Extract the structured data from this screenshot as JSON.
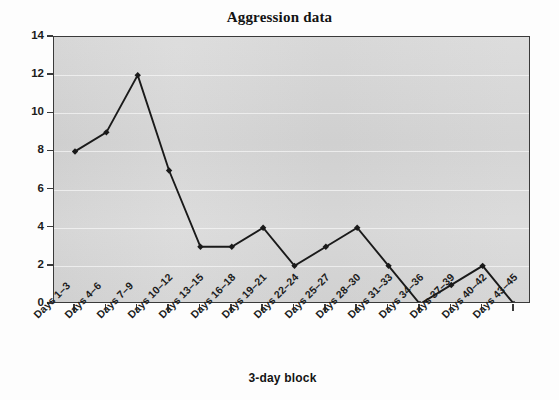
{
  "chart_data": {
    "type": "line",
    "title": "Aggression data",
    "xlabel": "3-day block",
    "ylabel": "Frequency",
    "categories": [
      "Days 1–3",
      "Days 4–6",
      "Days 7–9",
      "Days 10–12",
      "Days 13–15",
      "Days 16–18",
      "Days 19–21",
      "Days 22–24",
      "Days 25–27",
      "Days 28–30",
      "Days 31–33",
      "Days 34–36",
      "Days 37–39",
      "Days 40–42",
      "Days 43–45"
    ],
    "values": [
      8,
      9,
      12,
      7,
      3,
      3,
      4,
      2,
      3,
      4,
      2,
      0,
      1,
      2,
      0
    ],
    "ylim": [
      0,
      14
    ],
    "ytick_labels": [
      "0",
      "2",
      "4",
      "6",
      "8",
      "10",
      "12",
      "14"
    ],
    "ytick_values": [
      0,
      2,
      4,
      6,
      8,
      10,
      12,
      14
    ],
    "grid": true,
    "legend": "none",
    "marker": "diamond",
    "series_color": "#1a1a1a",
    "plot_background": "#d9d9d9",
    "figure_background": "#fdfdfd",
    "gridline_color": "#ffffff",
    "axis_color": "#3a3a3a"
  }
}
